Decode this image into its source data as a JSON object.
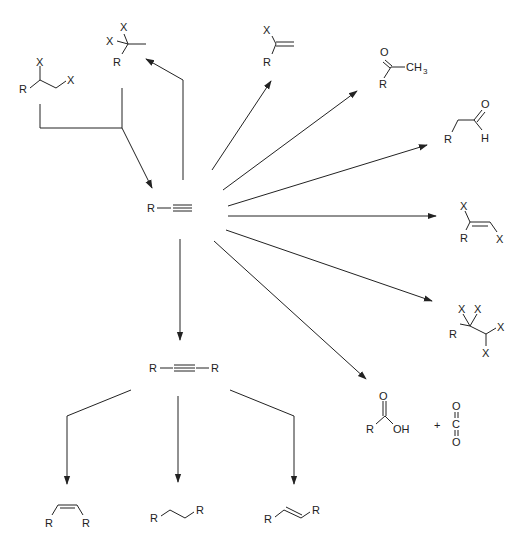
{
  "diagram": {
    "center": {
      "name": "terminal-alkyne",
      "label_R": "R"
    },
    "internal_alkyne": {
      "left": "R",
      "right": "R"
    },
    "labels": {
      "R": "R",
      "X": "X",
      "O": "O",
      "H": "H",
      "OH": "OH",
      "C": "C",
      "CH": "CH",
      "three": "3",
      "plus": "+"
    },
    "products": [
      {
        "id": "vicinal-dihalide-start",
        "desc": "R-CH(X)-CH2X"
      },
      {
        "id": "gem-dihalide",
        "desc": "R-C(X)(X)-CH3"
      },
      {
        "id": "vinyl-halide",
        "desc": "R-C(X)=CH2"
      },
      {
        "id": "methyl-ketone",
        "desc": "R-C(=O)-CH3"
      },
      {
        "id": "aldehyde",
        "desc": "R-CH2-CHO"
      },
      {
        "id": "dihaloalkene",
        "desc": "R(X)C=CHX"
      },
      {
        "id": "tetrahaloalkane",
        "desc": "R-CX2-CHX2"
      },
      {
        "id": "carboxylic-acid-co2",
        "desc": "RCOOH + CO2"
      },
      {
        "id": "cis-alkene",
        "desc": "cis R-CH=CH-R"
      },
      {
        "id": "alkane",
        "desc": "R-CH2-CH2-R"
      },
      {
        "id": "trans-alkene",
        "desc": "trans R-CH=CH-R"
      }
    ],
    "colors": {
      "ink": "#222222",
      "background": "#ffffff"
    }
  }
}
